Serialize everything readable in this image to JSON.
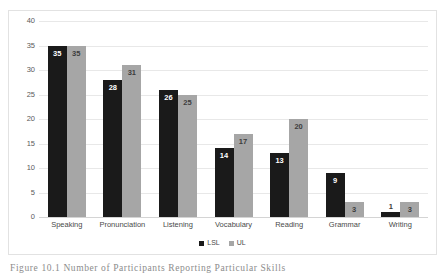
{
  "figure": {
    "caption": "Figure 10.1   Number of Participants Reporting Particular Skills"
  },
  "chart_data": {
    "type": "bar",
    "title": "",
    "xlabel": "",
    "ylabel": "",
    "ylim": [
      0,
      40
    ],
    "yticks": [
      "0",
      "5",
      "10",
      "15",
      "20",
      "25",
      "30",
      "35",
      "40"
    ],
    "grid": true,
    "legend_position": "bottom",
    "categories": [
      "Speaking",
      "Pronunciation",
      "Listening",
      "Vocabulary",
      "Reading",
      "Grammar",
      "Writing"
    ],
    "series": [
      {
        "name": "LSL",
        "color": "#1a1a1a",
        "values": [
          35,
          28,
          26,
          14,
          13,
          9,
          1
        ]
      },
      {
        "name": "UL",
        "color": "#a6a6a6",
        "values": [
          35,
          31,
          25,
          17,
          20,
          3,
          3
        ]
      }
    ]
  }
}
